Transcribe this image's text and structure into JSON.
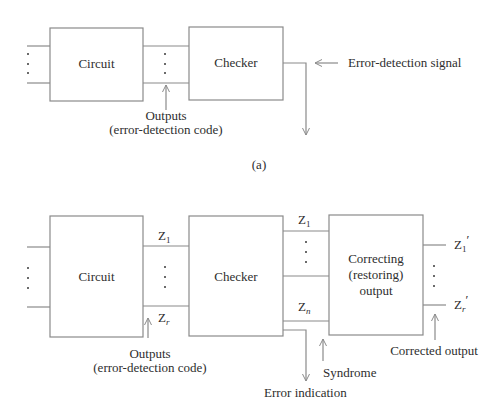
{
  "figure_a": {
    "caption": "(a)",
    "blocks": {
      "circuit": "Circuit",
      "checker": "Checker"
    },
    "annotations": {
      "outputs_line1": "Outputs",
      "outputs_line2": "(error-detection code)",
      "error_signal": "Error-detection signal"
    }
  },
  "figure_b": {
    "blocks": {
      "circuit": "Circuit",
      "checker": "Checker",
      "correcting_line1": "Correcting",
      "correcting_line2": "(restoring)",
      "correcting_line3": "output"
    },
    "signals": {
      "z": "Z",
      "sub_1": "1",
      "sub_r": "r",
      "sub_n": "n",
      "prime": "′"
    },
    "annotations": {
      "outputs_line1": "Outputs",
      "outputs_line2": "(error-detection code)",
      "error_indication": "Error indication",
      "syndrome": "Syndrome",
      "corrected_output": "Corrected output"
    }
  },
  "colors": {
    "line": "#8a8a8a",
    "text": "#2e2e2e",
    "background": "#ffffff"
  }
}
